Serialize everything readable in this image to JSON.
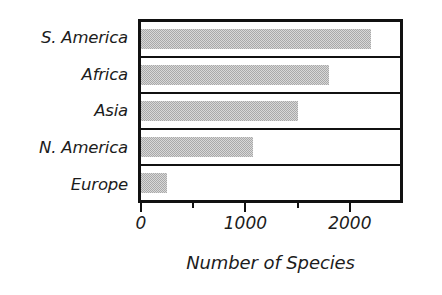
{
  "chart_data": {
    "type": "bar",
    "orientation": "horizontal",
    "title": "",
    "xlabel": "Number of Species",
    "ylabel": "",
    "categories": [
      "S. America",
      "Africa",
      "Asia",
      "N. America",
      "Europe"
    ],
    "values": [
      2200,
      1800,
      1500,
      1070,
      250
    ],
    "xlim": [
      0,
      2480
    ],
    "ylim": null,
    "xticks": [
      0,
      1000,
      2000
    ],
    "xticklabels": [
      "0",
      "1000",
      "2000"
    ],
    "xminorticks": [
      500,
      1500
    ],
    "grid": false,
    "legend": null,
    "bar_color": "#a9a9a9",
    "frame_color": "#111111",
    "series": [
      {
        "name": "Number of Species",
        "values": [
          2200,
          1800,
          1500,
          1070,
          250
        ]
      }
    ],
    "points": [
      {
        "category": "S. America",
        "value": 2200
      },
      {
        "category": "Africa",
        "value": 1800
      },
      {
        "category": "Asia",
        "value": 1500
      },
      {
        "category": "N. America",
        "value": 1070
      },
      {
        "category": "Europe",
        "value": 250
      }
    ]
  },
  "axis": {
    "tick_labels": [
      "0",
      "1000",
      "2000"
    ],
    "title": "Number of Species"
  },
  "categories": {
    "0": "S. America",
    "1": "Africa",
    "2": "Asia",
    "3": "N. America",
    "4": "Europe"
  }
}
